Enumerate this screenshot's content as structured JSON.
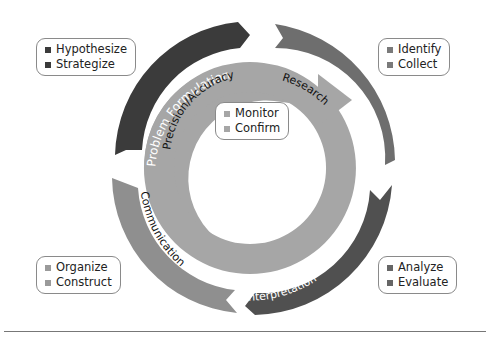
{
  "diagram": {
    "type": "cycle",
    "outer_stages": [
      {
        "label": "Problem Formulation",
        "color": "#3b3b3b",
        "text_color": "#ffffff",
        "bullets": [
          "Hypothesize",
          "Strategize"
        ]
      },
      {
        "label": "Research",
        "color": "#6e6e6e",
        "text_color": "#111111",
        "bullets": [
          "Identify",
          "Collect"
        ]
      },
      {
        "label": "Interpretation",
        "color": "#525252",
        "text_color": "#ffffff",
        "bullets": [
          "Analyze",
          "Evaluate"
        ]
      },
      {
        "label": "Communication",
        "color": "#8f8f8f",
        "text_color": "#111111",
        "bullets": [
          "Organize",
          "Construct"
        ]
      }
    ],
    "inner_ring": {
      "label": "Precision/Accuracy",
      "color": "#a6a6a6",
      "bullets": [
        "Monitor",
        "Confirm"
      ]
    }
  },
  "callouts": {
    "problem_formulation": {
      "items": [
        "Hypothesize",
        "Strategize"
      ],
      "bullet_color": "#3b3b3b"
    },
    "research": {
      "items": [
        "Identify",
        "Collect"
      ],
      "bullet_color": "#7a7a7a"
    },
    "precision": {
      "items": [
        "Monitor",
        "Confirm"
      ],
      "bullet_color": "#a6a6a6"
    },
    "interpretation": {
      "items": [
        "Analyze",
        "Evaluate"
      ],
      "bullet_color": "#666666"
    },
    "communication": {
      "items": [
        "Organize",
        "Construct"
      ],
      "bullet_color": "#9a9a9a"
    }
  },
  "labels": {
    "problem_formulation": "Problem Formulation",
    "research": "Research",
    "interpretation": "Interpretation",
    "communication": "Communication",
    "precision": "Precision/Accuracy"
  }
}
